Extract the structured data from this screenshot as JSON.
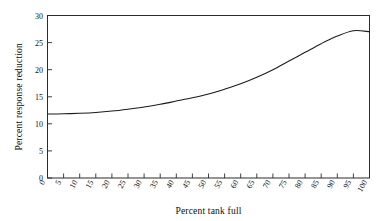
{
  "chart_data": {
    "type": "line",
    "title": "",
    "xlabel": "Percent tank full",
    "ylabel": "Percent response reduction",
    "xlim": [
      0,
      100
    ],
    "ylim": [
      0,
      30
    ],
    "grid": false,
    "legend": false,
    "xticks": [
      0,
      5,
      10,
      15,
      20,
      25,
      30,
      35,
      40,
      45,
      50,
      55,
      60,
      65,
      70,
      75,
      80,
      85,
      90,
      95,
      100
    ],
    "xtick_labels": [
      "0",
      "5",
      "10",
      "15",
      "20",
      "25",
      "30",
      "35",
      "40",
      "45",
      "50",
      "55",
      "60",
      "65",
      "70",
      "75",
      "80",
      "85",
      "90",
      "95",
      "100"
    ],
    "yticks": [
      0,
      5,
      10,
      15,
      20,
      25,
      30
    ],
    "ytick_labels": [
      "0",
      "5",
      "10",
      "15",
      "20",
      "25",
      "30"
    ],
    "x": [
      0,
      5,
      10,
      15,
      20,
      25,
      30,
      35,
      40,
      45,
      50,
      55,
      60,
      65,
      70,
      75,
      80,
      85,
      90,
      95,
      100
    ],
    "series": [
      {
        "name": "response reduction",
        "color": "#1a1a1a",
        "values": [
          11.8,
          11.85,
          11.95,
          12.1,
          12.35,
          12.7,
          13.1,
          13.6,
          14.2,
          14.8,
          15.5,
          16.4,
          17.4,
          18.6,
          20.0,
          21.6,
          23.2,
          24.8,
          26.2,
          27.2,
          27.0
        ]
      }
    ]
  },
  "axes": {
    "x_title": "Percent tank full",
    "y_title": "Percent response reduction"
  }
}
